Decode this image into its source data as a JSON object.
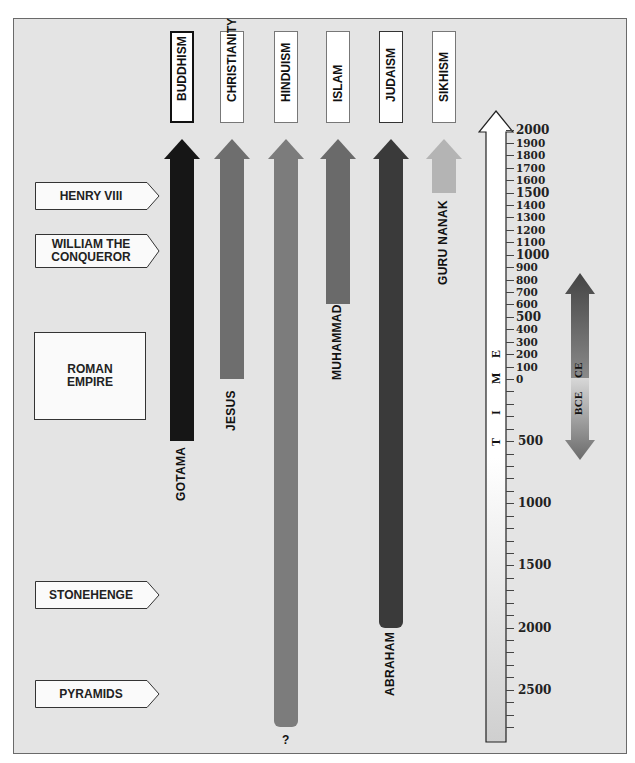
{
  "religions": [
    {
      "name": "BUDDHISM",
      "founder": "GOTAMA",
      "start_year": -500,
      "color": "#161616",
      "label_border": "thick"
    },
    {
      "name": "CHRISTIANITY",
      "founder": "JESUS",
      "start_year": 0,
      "color": "#6e6e6e",
      "label_border": "normal"
    },
    {
      "name": "HINDUISM",
      "founder": "?",
      "start_year": -2800,
      "color": "#7c7c7c",
      "label_border": "normal"
    },
    {
      "name": "ISLAM",
      "founder": "MUHAMMAD",
      "start_year": 600,
      "color": "#6a6a6a",
      "label_border": "normal"
    },
    {
      "name": "JUDAISM",
      "founder": "ABRAHAM",
      "start_year": -2000,
      "color": "#3a3a3a",
      "label_border": "dark"
    },
    {
      "name": "SIKHISM",
      "founder": "GURU NANAK",
      "start_year": 1500,
      "color": "#b4b4b4",
      "label_border": "light"
    }
  ],
  "events": [
    {
      "label": "HENRY VIII",
      "year": 1500
    },
    {
      "label": "WILLIAM THE CONQUEROR",
      "line1": "WILLIAM THE",
      "line2": "CONQUEROR",
      "year": 1066
    },
    {
      "label": "ROMAN EMPIRE",
      "line1": "ROMAN",
      "line2": "EMPIRE",
      "span": [
        -500,
        400
      ]
    },
    {
      "label": "STONEHENGE",
      "year": -1500
    },
    {
      "label": "PYRAMIDS",
      "year": -2500
    }
  ],
  "time_axis": {
    "title_letters": [
      "T",
      "I",
      "M",
      "E"
    ],
    "ce_ticks": [
      "2000",
      "1900",
      "1800",
      "1700",
      "1600",
      "1500",
      "1400",
      "1300",
      "1200",
      "1100",
      "1000",
      "900",
      "800",
      "700",
      "600",
      "500",
      "400",
      "300",
      "200",
      "100",
      "0"
    ],
    "bce_ticks": [
      "500",
      "1000",
      "1500",
      "2000",
      "2500"
    ]
  },
  "era_arrow": {
    "ce_label": "CE",
    "bce_label": "BCE"
  },
  "chart_data": {
    "type": "timeline",
    "title": "",
    "axis": {
      "label": "TIME",
      "range_ce": [
        0,
        2000
      ],
      "range_bce": [
        0,
        2800
      ],
      "ticks_ce_step": 100,
      "ticks_bce_labeled": [
        500,
        1000,
        1500,
        2000,
        2500
      ]
    },
    "series": [
      {
        "name": "BUDDHISM",
        "founder": "GOTAMA",
        "start": -500,
        "end": 2000
      },
      {
        "name": "CHRISTIANITY",
        "founder": "JESUS",
        "start": 0,
        "end": 2000
      },
      {
        "name": "HINDUISM",
        "founder": "?",
        "start": -2800,
        "end": 2000
      },
      {
        "name": "ISLAM",
        "founder": "MUHAMMAD",
        "start": 600,
        "end": 2000
      },
      {
        "name": "JUDAISM",
        "founder": "ABRAHAM",
        "start": -2000,
        "end": 2000
      },
      {
        "name": "SIKHISM",
        "founder": "GURU NANAK",
        "start": 1500,
        "end": 2000
      }
    ],
    "annotations": [
      {
        "label": "HENRY VIII",
        "year": 1500
      },
      {
        "label": "WILLIAM THE CONQUEROR",
        "year": 1066
      },
      {
        "label": "ROMAN EMPIRE",
        "year_range": [
          -500,
          400
        ]
      },
      {
        "label": "STONEHENGE",
        "year": -1500
      },
      {
        "label": "PYRAMIDS",
        "year": -2500
      }
    ],
    "legend": [
      "CE",
      "BCE"
    ]
  }
}
